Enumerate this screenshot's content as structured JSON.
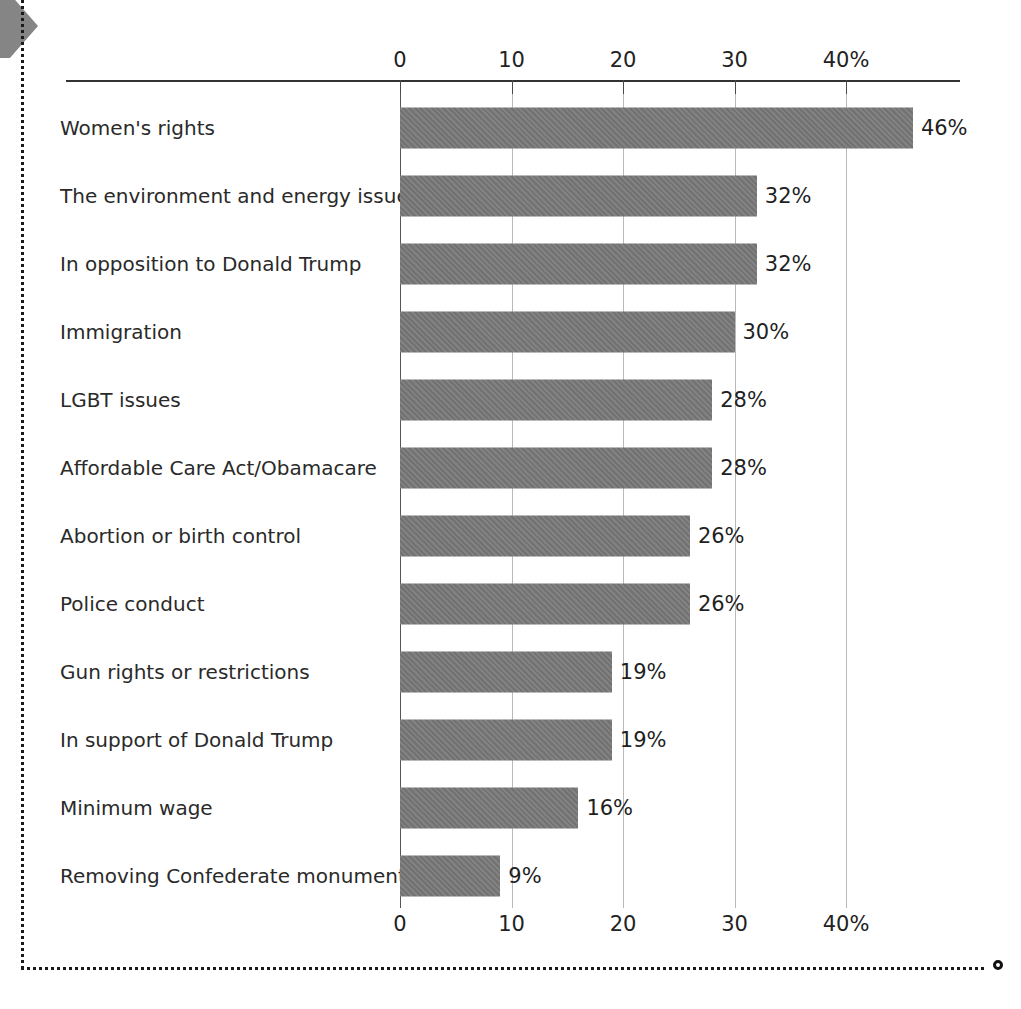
{
  "chart_data": {
    "type": "bar",
    "orientation": "horizontal",
    "title": "",
    "subtitle": "",
    "xlabel": "",
    "ylabel": "",
    "xlim": [
      0,
      46
    ],
    "grid": true,
    "legend": null,
    "axis_ticks": [
      "0",
      "10",
      "20",
      "30",
      "40%"
    ],
    "axis_tick_values": [
      0,
      10,
      20,
      30,
      40
    ],
    "axis_position": "both top and bottom",
    "value_suffix": "%",
    "categories": [
      "Women's rights",
      "The environment and energy issues",
      "In opposition to Donald Trump",
      "Immigration",
      "LGBT issues",
      "Affordable Care Act/Obamacare",
      "Abortion or birth control",
      "Police conduct",
      "Gun rights or restrictions",
      "In support of Donald Trump",
      "Minimum wage",
      "Removing Confederate monuments"
    ],
    "values": [
      46,
      32,
      32,
      30,
      28,
      28,
      26,
      26,
      19,
      19,
      16,
      9
    ],
    "value_labels": [
      "46%",
      "32%",
      "32%",
      "30%",
      "28%",
      "28%",
      "26%",
      "26%",
      "19%",
      "19%",
      "16%",
      "9%"
    ]
  },
  "colors": {
    "bar_fill": "#787878",
    "gridline": "#b9b9b9",
    "axis": "#333333",
    "text": "#2a2a2a",
    "corner_arrow": "#858585",
    "dotted_border": "#1a1a1a"
  },
  "decorations": {
    "corner_arrow_name": "arrow-marker",
    "dotted_border_name": "dotted-frame",
    "end_circle_name": "end-circle-marker"
  }
}
